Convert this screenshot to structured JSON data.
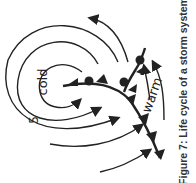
{
  "figure": {
    "caption": "Figure 7: Life cycle of a storm system",
    "labels": {
      "cold": "cold",
      "warm": "warm",
      "stage_number": "5"
    },
    "elements": [
      "cold-front-icon",
      "warm-front-icon",
      "occluded-front-icon",
      "wind-arrow-icon"
    ],
    "colors": {
      "ink": "#222222",
      "background": "#ffffff"
    }
  }
}
